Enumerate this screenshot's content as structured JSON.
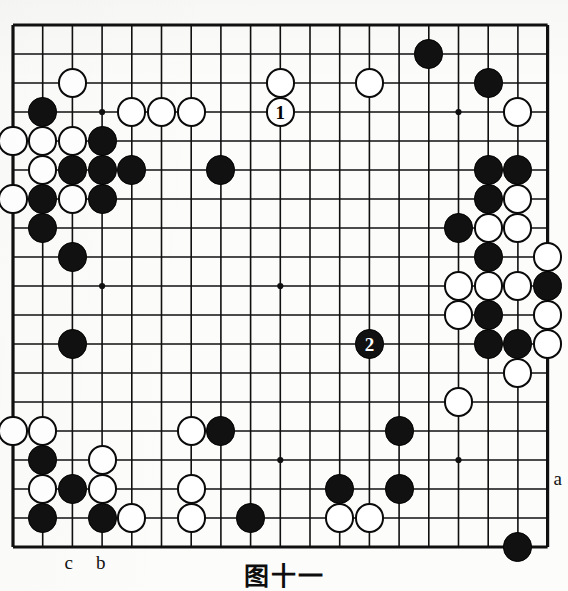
{
  "caption": "图十一",
  "board": {
    "size": 19,
    "origin_x": 13,
    "origin_y": 25,
    "step_x": 29.7,
    "step_y": 29.0,
    "line_color": "#101010",
    "background_color": "#fcfcfa",
    "black_color": "#111111",
    "white_color": "#ffffff",
    "star_points": [
      [
        3,
        3
      ],
      [
        9,
        3
      ],
      [
        15,
        3
      ],
      [
        3,
        9
      ],
      [
        9,
        9
      ],
      [
        15,
        9
      ],
      [
        3,
        15
      ],
      [
        9,
        15
      ],
      [
        15,
        15
      ]
    ]
  },
  "stones": {
    "black": [
      [
        1,
        3
      ],
      [
        3,
        4
      ],
      [
        2,
        5
      ],
      [
        3,
        5
      ],
      [
        4,
        5
      ],
      [
        1,
        6
      ],
      [
        3,
        6
      ],
      [
        1,
        7
      ],
      [
        2,
        8
      ],
      [
        7,
        5
      ],
      [
        14,
        1
      ],
      [
        16,
        2
      ],
      [
        16,
        5
      ],
      [
        17,
        5
      ],
      [
        16,
        6
      ],
      [
        15,
        7
      ],
      [
        16,
        8
      ],
      [
        16,
        10
      ],
      [
        16,
        11
      ],
      [
        17,
        11
      ],
      [
        18,
        9
      ],
      [
        2,
        11
      ],
      [
        7,
        14
      ],
      [
        1,
        15
      ],
      [
        2,
        16
      ],
      [
        1,
        17
      ],
      [
        3,
        17
      ],
      [
        8,
        17
      ],
      [
        13,
        14
      ],
      [
        11,
        16
      ],
      [
        13,
        16
      ],
      [
        17,
        18
      ]
    ],
    "white": [
      [
        2,
        2
      ],
      [
        4,
        3
      ],
      [
        5,
        3
      ],
      [
        6,
        3
      ],
      [
        0,
        4
      ],
      [
        1,
        4
      ],
      [
        2,
        4
      ],
      [
        1,
        5
      ],
      [
        0,
        6
      ],
      [
        2,
        6
      ],
      [
        9,
        2
      ],
      [
        12,
        2
      ],
      [
        17,
        3
      ],
      [
        17,
        6
      ],
      [
        16,
        7
      ],
      [
        17,
        7
      ],
      [
        15,
        9
      ],
      [
        15,
        10
      ],
      [
        16,
        9
      ],
      [
        18,
        10
      ],
      [
        18,
        11
      ],
      [
        17,
        12
      ],
      [
        18,
        8
      ],
      [
        17,
        9
      ],
      [
        0,
        14
      ],
      [
        1,
        14
      ],
      [
        6,
        14
      ],
      [
        1,
        16
      ],
      [
        6,
        16
      ],
      [
        3,
        15
      ],
      [
        3,
        16
      ],
      [
        4,
        17
      ],
      [
        6,
        17
      ],
      [
        11,
        17
      ],
      [
        12,
        17
      ],
      [
        15,
        13
      ]
    ]
  },
  "move_markers": [
    {
      "number": "1",
      "col": 9,
      "row": 3,
      "stone": "white"
    },
    {
      "number": "2",
      "col": 12,
      "row": 11,
      "stone": "black"
    }
  ],
  "coord_labels": [
    {
      "text": "a",
      "col": 18,
      "row": 16,
      "dx": 6,
      "dy": -20
    },
    {
      "text": "b",
      "col": 3,
      "row": 18,
      "dx": -6,
      "dy": 6
    },
    {
      "text": "c",
      "col": 2,
      "row": 18,
      "dx": -8,
      "dy": 6
    }
  ]
}
